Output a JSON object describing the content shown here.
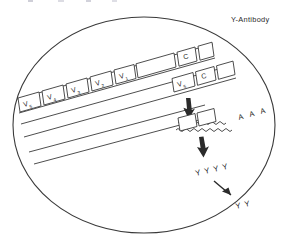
{
  "figure": {
    "title_fragment": "",
    "background_color": "#ffffff",
    "ink_color": "#2b2b2b"
  },
  "legend": {
    "antibody_label": "Y-Antibody",
    "antibody_symbol": "Y"
  },
  "germline_strand": {
    "name": "germline-immunoglobulin-gene",
    "v_segments": [
      {
        "label": "V",
        "subscript": "5"
      },
      {
        "label": "V",
        "subscript": "4"
      },
      {
        "label": "V",
        "subscript": "3"
      },
      {
        "label": "V",
        "subscript": "2"
      },
      {
        "label": "V",
        "subscript": "1"
      }
    ],
    "constant_segment": {
      "label": "C"
    }
  },
  "rearranged_strand": {
    "name": "rearranged-immunoglobulin-gene",
    "segments": [
      {
        "label": "V",
        "subscript": "5"
      },
      {
        "label": "C",
        "subscript": ""
      }
    ]
  },
  "mrna": {
    "name": "messenger-rna",
    "poly_a_tail": [
      "A",
      "A",
      "A"
    ],
    "exon_boxes": 2
  },
  "protein": {
    "name": "antibody-molecules-intracellular",
    "symbols": [
      "Y",
      "Y",
      "Y",
      "Y"
    ]
  },
  "secreted": {
    "name": "antibody-molecules-secreted",
    "symbols": [
      "Y",
      "Y"
    ]
  },
  "arrows": [
    {
      "name": "transcription-arrow",
      "direction": "down"
    },
    {
      "name": "translation-arrow",
      "direction": "down"
    },
    {
      "name": "secretion-arrow",
      "direction": "down-right-curved"
    }
  ]
}
